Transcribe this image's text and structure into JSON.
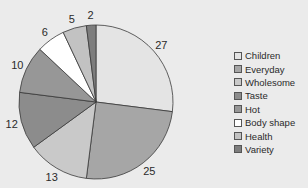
{
  "chart_data": {
    "type": "pie",
    "title": "",
    "categories": [
      "Children",
      "Everyday",
      "Wholesome",
      "Taste",
      "Hot",
      "Body shape",
      "Health",
      "Variety"
    ],
    "values": [
      27,
      25,
      13,
      12,
      10,
      6,
      5,
      2
    ],
    "colors": [
      "#e4e4e4",
      "#a6a6a6",
      "#c9c9c9",
      "#8c8c8c",
      "#979797",
      "#ffffff",
      "#c2c2c2",
      "#7d7d7d"
    ],
    "start_angle": "12 o'clock",
    "direction": "clockwise",
    "data_labels": [
      "27",
      "25",
      "13",
      "12",
      "10",
      "6",
      "5",
      "2"
    ],
    "legend_position": "right"
  },
  "legend": {
    "items": [
      {
        "label": "Children",
        "color": "#e4e4e4"
      },
      {
        "label": "Everyday",
        "color": "#a6a6a6"
      },
      {
        "label": "Wholesome",
        "color": "#c9c9c9"
      },
      {
        "label": "Taste",
        "color": "#8c8c8c"
      },
      {
        "label": "Hot",
        "color": "#979797"
      },
      {
        "label": "Body shape",
        "color": "#ffffff"
      },
      {
        "label": "Health",
        "color": "#c2c2c2"
      },
      {
        "label": "Variety",
        "color": "#7d7d7d"
      }
    ]
  }
}
